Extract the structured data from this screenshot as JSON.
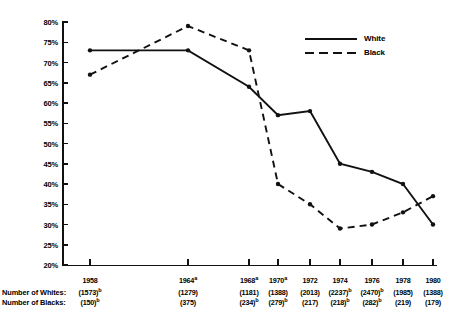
{
  "chart_data": {
    "type": "line",
    "title": "",
    "xlabel": "",
    "ylabel": "",
    "ylim": [
      20,
      80
    ],
    "ytick_step": 5,
    "grid": false,
    "legend_position": "top-right",
    "categories": [
      "1958",
      "1964",
      "1968",
      "1970",
      "1972",
      "1974",
      "1976",
      "1978",
      "1980"
    ],
    "category_marks": [
      "",
      "a",
      "a",
      "a",
      "",
      "",
      "",
      "",
      ""
    ],
    "series": [
      {
        "name": "White",
        "style": "solid",
        "values": [
          73,
          73,
          64,
          57,
          58,
          45,
          43,
          40,
          30
        ]
      },
      {
        "name": "Black",
        "style": "dashed",
        "values": [
          67,
          79,
          73,
          40,
          35,
          29,
          30,
          33,
          37
        ]
      }
    ],
    "ytick_labels": [
      "80%",
      "75%",
      "70%",
      "65%",
      "60%",
      "55%",
      "50%",
      "45%",
      "40%",
      "35%",
      "30%",
      "25%",
      "20%"
    ],
    "footer_rows": [
      {
        "label": "Number of Whites:",
        "values": [
          "(1573)",
          "(1279)",
          "(1181)",
          "(1388)",
          "(2013)",
          "(2237)",
          "(2470)",
          "(1985)",
          "(1388)"
        ],
        "marks": [
          "b",
          "",
          "",
          "",
          "",
          "b",
          "b",
          "",
          ""
        ]
      },
      {
        "label": "Number of Blacks:",
        "values": [
          "(150)",
          "(375)",
          "(234)",
          "(279)",
          "(217)",
          "(218)",
          "(282)",
          "(219)",
          "(179)"
        ],
        "marks": [
          "b",
          "",
          "b",
          "b",
          "",
          "b",
          "b",
          "",
          ""
        ]
      }
    ]
  },
  "legend": {
    "items": [
      {
        "label": "White",
        "style": "solid"
      },
      {
        "label": "Black",
        "style": "dashed"
      }
    ]
  },
  "colors": {
    "ink": "#111111",
    "background": "#ffffff"
  }
}
